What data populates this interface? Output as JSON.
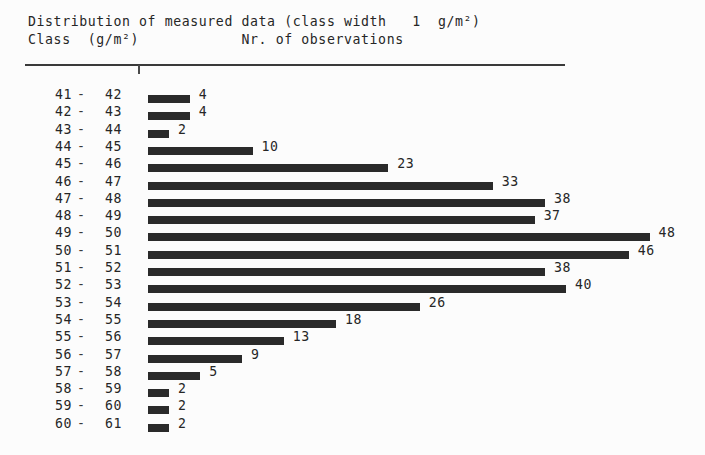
{
  "header": {
    "title": "Distribution of measured data (class width   1  g/m²)",
    "subtitle": "Class  (g/m²)            Nr. of observations",
    "col_class_label": "Class  (g/m²)",
    "col_observations_label": "Nr. of observations",
    "class_width": "1",
    "unit": "g/m²"
  },
  "colors": {
    "bar": "#2a2a2a",
    "text": "#262626",
    "rule": "#3a3a3a",
    "background": "#fcfcfc"
  },
  "chart_data": {
    "type": "bar",
    "orientation": "horizontal",
    "title": "Distribution of measured data (class width   1  g/m²)",
    "xlabel": "Nr. of observations",
    "ylabel": "Class  (g/m²)",
    "grid": false,
    "legend": false,
    "xlim": [
      0,
      48
    ],
    "px_per_unit": 10.45,
    "categories": [
      "41 - 42",
      "42 - 43",
      "43 - 44",
      "44 - 45",
      "45 - 46",
      "46 - 47",
      "47 - 48",
      "48 - 49",
      "49 - 50",
      "50 - 51",
      "51 - 52",
      "52 - 53",
      "53 - 54",
      "54 - 55",
      "55 - 56",
      "56 - 57",
      "57 - 58",
      "58 - 59",
      "59 - 60",
      "60 - 61"
    ],
    "values": [
      4,
      4,
      2,
      10,
      23,
      33,
      38,
      37,
      48,
      46,
      38,
      40,
      26,
      18,
      13,
      9,
      5,
      2,
      2,
      2
    ],
    "rows": [
      {
        "lo": "41",
        "dash": "-",
        "hi": "42",
        "value": 4,
        "value_label": "4"
      },
      {
        "lo": "42",
        "dash": "-",
        "hi": "43",
        "value": 4,
        "value_label": "4"
      },
      {
        "lo": "43",
        "dash": "-",
        "hi": "44",
        "value": 2,
        "value_label": "2"
      },
      {
        "lo": "44",
        "dash": "-",
        "hi": "45",
        "value": 10,
        "value_label": "10"
      },
      {
        "lo": "45",
        "dash": "-",
        "hi": "46",
        "value": 23,
        "value_label": "23"
      },
      {
        "lo": "46",
        "dash": "-",
        "hi": "47",
        "value": 33,
        "value_label": "33"
      },
      {
        "lo": "47",
        "dash": "-",
        "hi": "48",
        "value": 38,
        "value_label": "38"
      },
      {
        "lo": "48",
        "dash": "-",
        "hi": "49",
        "value": 37,
        "value_label": "37"
      },
      {
        "lo": "49",
        "dash": "-",
        "hi": "50",
        "value": 48,
        "value_label": "48"
      },
      {
        "lo": "50",
        "dash": "-",
        "hi": "51",
        "value": 46,
        "value_label": "46"
      },
      {
        "lo": "51",
        "dash": "-",
        "hi": "52",
        "value": 38,
        "value_label": "38"
      },
      {
        "lo": "52",
        "dash": "-",
        "hi": "53",
        "value": 40,
        "value_label": "40"
      },
      {
        "lo": "53",
        "dash": "-",
        "hi": "54",
        "value": 26,
        "value_label": "26"
      },
      {
        "lo": "54",
        "dash": "-",
        "hi": "55",
        "value": 18,
        "value_label": "18"
      },
      {
        "lo": "55",
        "dash": "-",
        "hi": "56",
        "value": 13,
        "value_label": "13"
      },
      {
        "lo": "56",
        "dash": "-",
        "hi": "57",
        "value": 9,
        "value_label": "9"
      },
      {
        "lo": "57",
        "dash": "-",
        "hi": "58",
        "value": 5,
        "value_label": "5"
      },
      {
        "lo": "58",
        "dash": "-",
        "hi": "59",
        "value": 2,
        "value_label": "2"
      },
      {
        "lo": "59",
        "dash": "-",
        "hi": "60",
        "value": 2,
        "value_label": "2"
      },
      {
        "lo": "60",
        "dash": "-",
        "hi": "61",
        "value": 2,
        "value_label": "2"
      }
    ]
  }
}
